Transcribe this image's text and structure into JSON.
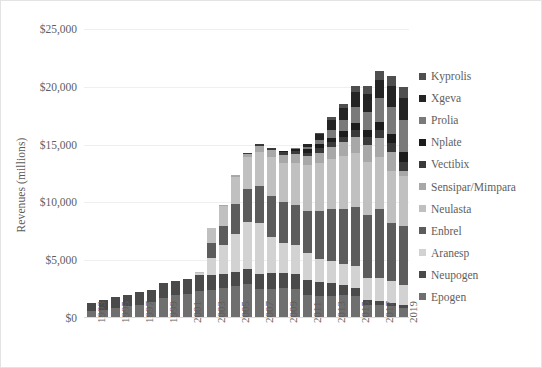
{
  "chart_data": {
    "type": "bar",
    "title": "",
    "subtitle": "",
    "xlabel": "",
    "ylabel": "Revenues (millions)",
    "stacked": true,
    "grid": true,
    "legend_position": "right",
    "ylim": [
      0,
      25000
    ],
    "yticks": [
      0,
      5000,
      10000,
      15000,
      20000,
      25000
    ],
    "ytick_labels": [
      "$0",
      "$5,000",
      "$10,000",
      "$15,000",
      "$20,000",
      "$25,000"
    ],
    "categories": [
      1993,
      1994,
      1995,
      1996,
      1997,
      1998,
      1999,
      2000,
      2001,
      2002,
      2003,
      2004,
      2005,
      2006,
      2007,
      2008,
      2009,
      2010,
      2011,
      2012,
      2013,
      2014,
      2015,
      2016,
      2017,
      2018,
      2019
    ],
    "xtick_labels": [
      "1993",
      "",
      "1995",
      "",
      "1997",
      "",
      "1999",
      "",
      "2001",
      "",
      "2003",
      "",
      "2005",
      "",
      "2007",
      "",
      "2009",
      "",
      "2011",
      "",
      "2013",
      "",
      "2015",
      "",
      "2017",
      "",
      "2019"
    ],
    "series": [
      {
        "name": "Epogen",
        "color": "#6f6f6f",
        "values": [
          587,
          720,
          883,
          1000,
          1160,
          1350,
          1760,
          1960,
          2100,
          2300,
          2400,
          2600,
          2800,
          2900,
          2500,
          2500,
          2600,
          2500,
          2000,
          1900,
          1900,
          2000,
          1900,
          1100,
          1100,
          1000,
          900
        ]
      },
      {
        "name": "Neupogen",
        "color": "#4a4a4a",
        "values": [
          719,
          830,
          930,
          1000,
          1060,
          1110,
          1260,
          1220,
          1300,
          1400,
          1300,
          1200,
          1200,
          1300,
          1300,
          1400,
          1300,
          1300,
          1300,
          1200,
          1100,
          900,
          700,
          500,
          400,
          300,
          200
        ]
      },
      {
        "name": "Aranesp",
        "color": "#d2d2d2",
        "values": [
          0,
          0,
          0,
          0,
          0,
          0,
          0,
          0,
          0,
          160,
          1500,
          2500,
          3300,
          4100,
          4400,
          3100,
          2600,
          2500,
          2300,
          2000,
          1900,
          1800,
          1900,
          1900,
          2000,
          1900,
          1800
        ]
      },
      {
        "name": "Enbrel",
        "color": "#5c5c5c",
        "values": [
          0,
          0,
          0,
          0,
          0,
          0,
          0,
          0,
          0,
          0,
          1300,
          1700,
          2600,
          2900,
          3200,
          3600,
          3500,
          3500,
          3700,
          4200,
          4500,
          4700,
          5100,
          5400,
          5900,
          5000,
          5100
        ]
      },
      {
        "name": "Neulasta",
        "color": "#c0c0c0",
        "values": [
          0,
          0,
          0,
          0,
          0,
          0,
          0,
          0,
          0,
          100,
          1300,
          1700,
          2300,
          2700,
          3000,
          3300,
          3400,
          3600,
          3900,
          4100,
          4400,
          4600,
          4700,
          4600,
          4500,
          4500,
          4300
        ]
      },
      {
        "name": "Sensipar/Mimpara",
        "color": "#a8a8a8",
        "values": [
          0,
          0,
          0,
          0,
          0,
          0,
          0,
          0,
          0,
          0,
          0,
          70,
          200,
          320,
          450,
          600,
          700,
          750,
          800,
          900,
          1000,
          1200,
          1400,
          1500,
          1700,
          1700,
          400
        ]
      },
      {
        "name": "Vectibix",
        "color": "#3a3a3a",
        "values": [
          0,
          0,
          0,
          0,
          0,
          0,
          0,
          0,
          0,
          0,
          0,
          0,
          0,
          40,
          170,
          200,
          240,
          280,
          320,
          370,
          400,
          500,
          600,
          650,
          700,
          750,
          800
        ]
      },
      {
        "name": "Nplate",
        "color": "#1c1c1c",
        "values": [
          0,
          0,
          0,
          0,
          0,
          0,
          0,
          0,
          0,
          0,
          0,
          0,
          0,
          0,
          0,
          40,
          150,
          220,
          280,
          350,
          400,
          450,
          550,
          600,
          700,
          800,
          900
        ]
      },
      {
        "name": "Prolia",
        "color": "#7a7a7a",
        "values": [
          0,
          0,
          0,
          0,
          0,
          0,
          0,
          0,
          0,
          0,
          0,
          0,
          0,
          0,
          0,
          0,
          0,
          30,
          200,
          400,
          700,
          1000,
          1400,
          1600,
          2000,
          2300,
          2700
        ]
      },
      {
        "name": "Xgeva",
        "color": "#242424",
        "values": [
          0,
          0,
          0,
          0,
          0,
          0,
          0,
          0,
          0,
          0,
          0,
          0,
          0,
          0,
          0,
          0,
          0,
          20,
          230,
          500,
          800,
          1000,
          1300,
          1500,
          1600,
          1800,
          1900
        ]
      },
      {
        "name": "Kyprolis",
        "color": "#4f4f4f",
        "values": [
          0,
          0,
          0,
          0,
          0,
          0,
          0,
          0,
          0,
          0,
          0,
          0,
          0,
          0,
          0,
          0,
          0,
          0,
          0,
          60,
          300,
          400,
          500,
          700,
          800,
          900,
          1000
        ]
      }
    ],
    "totals": [
      1306,
      1550,
      1813,
      2000,
      2220,
      2460,
      3020,
      3180,
      3400,
      3960,
      7800,
      9770,
      12400,
      14260,
      15020,
      14740,
      14480,
      14700,
      15030,
      15980,
      17400,
      18550,
      20050,
      20050,
      21400,
      20950,
      19100
    ]
  },
  "legend": {
    "items": [
      {
        "label": "Kyprolis"
      },
      {
        "label": "Xgeva"
      },
      {
        "label": "Prolia"
      },
      {
        "label": "Nplate"
      },
      {
        "label": "Vectibix"
      },
      {
        "label": "Sensipar/Mimpara"
      },
      {
        "label": "Neulasta"
      },
      {
        "label": "Enbrel"
      },
      {
        "label": "Aranesp"
      },
      {
        "label": "Neupogen"
      },
      {
        "label": "Epogen"
      }
    ]
  },
  "colors": {
    "background": "#ffffff",
    "border": "#e3e3e3",
    "gridline": "#efefef",
    "text": "#5e5e5e",
    "axis": "#d9d9d9"
  }
}
